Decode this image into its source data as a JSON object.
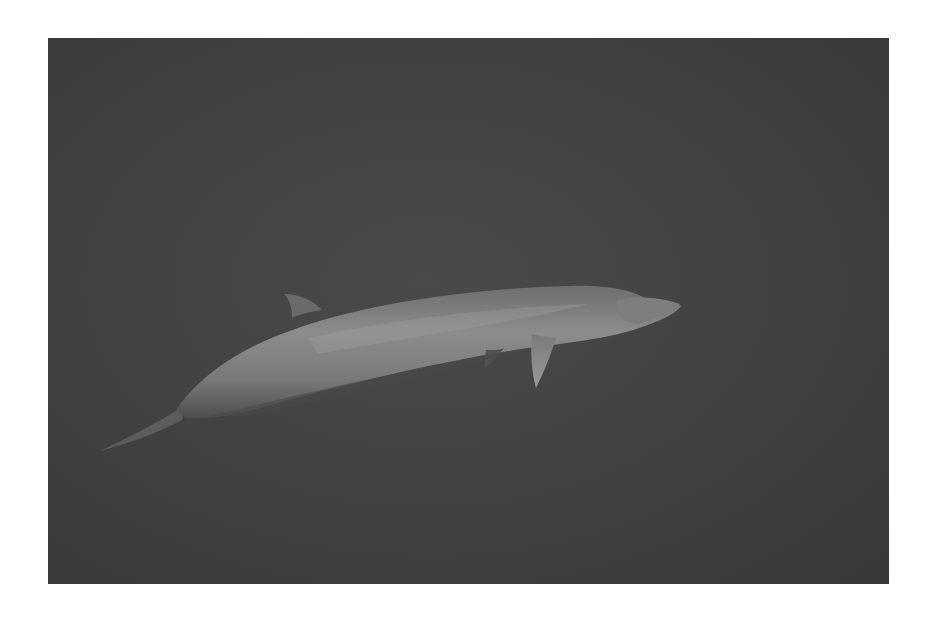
{
  "image": {
    "subject": "whale swimming underwater",
    "alt": "Grayscale photograph of a whale swimming underwater against a dark background",
    "colors": {
      "background_border": "#ffffff",
      "water": "#444444",
      "whale_body_light": "#8a8a8a",
      "whale_body_dark": "#5a5a5a"
    }
  }
}
